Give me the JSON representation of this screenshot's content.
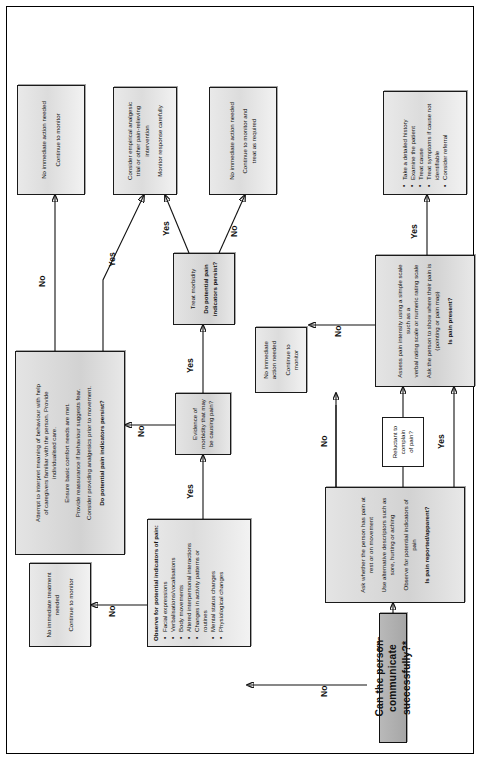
{
  "chart_type": "flowchart",
  "edge_labels": {
    "yes": "Yes",
    "no": "No"
  },
  "nodes": {
    "start": {
      "name": "start-question",
      "text": "Can the person communicate successfully?*"
    },
    "ask_verbal": {
      "name": "ask-verbal-assessment",
      "lines": [
        "Ask whether the person has pain at rest or on movement",
        "Use alternative descriptors such as sore, hurting or aching",
        "Observe for potential indicators of pain"
      ],
      "question": "Is pain reported/apparent?"
    },
    "reluctant": {
      "name": "reluctant-to-complain",
      "lines": [
        "Reluctant to complain",
        "of pain?"
      ]
    },
    "assess_intensity": {
      "name": "assess-pain-intensity",
      "lines": [
        "Assess pain intensity using a simple scale such as a",
        "verbal rating scale or numeric rating scale",
        "Ask the person to show where their pain is",
        "(pointing or pain map)"
      ],
      "question": "Is pain present?"
    },
    "no_action_verbal": {
      "name": "outcome-no-immediate-action-verbal",
      "lines": [
        "No immediate",
        "action needed",
        "Continue to",
        "monitor"
      ]
    },
    "history_actions": {
      "name": "outcome-detailed-history",
      "bullets": [
        "Take a detailed history",
        "Examine the patient",
        "Treat cause",
        "Treat symptoms if cause not",
        "identifiable",
        "Consider referral"
      ]
    },
    "observe_indicators": {
      "name": "observe-potential-indicators",
      "header": "Observe for potential indicators of pain:",
      "bullets": [
        "Facial expressions",
        "Verbalisations/vocalisations",
        "Body movements",
        "Altered interpersonal interactions",
        "Changes in activity patterns or",
        "routines",
        "Mental status changes",
        "Physiological changes"
      ]
    },
    "no_treatment": {
      "name": "outcome-no-immediate-treatment",
      "lines": [
        "No immediate treatment",
        "needed",
        "Continue to monitor"
      ]
    },
    "evidence_morbidity": {
      "name": "evidence-of-morbidity-question",
      "lines": [
        "Evidence of morbidity that may",
        "be causing pain?"
      ]
    },
    "treat_morbidity": {
      "name": "treat-morbidity-question",
      "lines": [
        "Treat morbidity"
      ],
      "question_lines": [
        "Do potential pain",
        "indicators persist?"
      ]
    },
    "interpret_behaviour": {
      "name": "interpret-behaviour-actions",
      "lines": [
        "Attempt to interpret meaning of behaviour with help",
        "of caregivers familiar with the person. Provide",
        "individualised care.",
        "Ensure basic comfort needs are met.",
        "Provide reassurance if behaviour suggests fear.",
        "Consider providing analgesics prior to movement."
      ],
      "question": "Do potential pain indicators persist?"
    },
    "no_action_monitor": {
      "name": "outcome-no-immediate-action-monitor",
      "lines": [
        "No immediate action needed",
        "Continue to monitor"
      ]
    },
    "empirical_analgesic": {
      "name": "outcome-empirical-analgesic-trial",
      "lines": [
        "Consider empirical analgesic",
        "trial or other pain-relieving",
        "intervention",
        "Monitor response carefully"
      ]
    },
    "no_action_treat": {
      "name": "outcome-no-action-monitor-and-treat",
      "lines": [
        "No immediate action needed",
        "Continue to monitor and",
        "treat as required"
      ]
    }
  },
  "colors": {
    "node_fill": "#dcdcdc",
    "title_fill": "#a6a6a6",
    "border": "#1a1a1a",
    "background": "#ffffff"
  }
}
